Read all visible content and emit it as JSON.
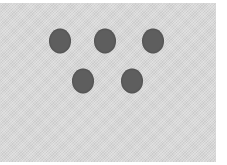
{
  "figure": {
    "background_color": "#d9d9d9",
    "dot_color": "#5e5e5e",
    "dot_count": 5,
    "dots": [
      {
        "row": 1,
        "x": 60,
        "y": 41
      },
      {
        "row": 1,
        "x": 105,
        "y": 41
      },
      {
        "row": 1,
        "x": 153,
        "y": 41
      },
      {
        "row": 2,
        "x": 83,
        "y": 81
      },
      {
        "row": 2,
        "x": 132,
        "y": 81
      }
    ]
  }
}
